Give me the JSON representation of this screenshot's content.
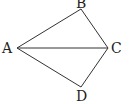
{
  "diagram": {
    "points": {
      "A": {
        "label": "A",
        "x": 17,
        "y": 48
      },
      "B": {
        "label": "B",
        "x": 81,
        "y": 9
      },
      "C": {
        "label": "C",
        "x": 108,
        "y": 48
      },
      "D": {
        "label": "D",
        "x": 81,
        "y": 87
      }
    },
    "segments": [
      "AB",
      "BC",
      "AC",
      "AD",
      "DC"
    ]
  }
}
